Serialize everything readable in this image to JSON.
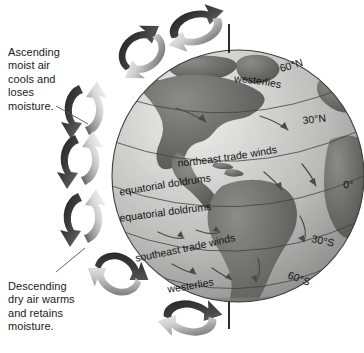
{
  "figure": {
    "background_color": "#ffffff",
    "ink_color": "#1a1a1a"
  },
  "callouts": [
    {
      "id": "ascending",
      "text": "Ascending\nmoist air\ncools and\nloses\nmoisture.",
      "leader_from": [
        56,
        106
      ],
      "leader_to": [
        88,
        124
      ]
    },
    {
      "id": "descending",
      "text": "Descending\ndry air warms\nand retains\nmoisture.",
      "leader_from": [
        56,
        272
      ],
      "leader_to": [
        85,
        248
      ]
    }
  ],
  "globe": {
    "center_x": 238,
    "center_y": 176,
    "radius": 126,
    "ocean_color": "#b8b8b8",
    "ocean_highlight": "#e8e8e6",
    "land_color": "#6f6f6f",
    "outline_color": "#4a4a4a",
    "axis_color": "#151515"
  },
  "latitude_labels": [
    {
      "id": "lat-60n",
      "text": "60°N",
      "x": 281,
      "y": 72,
      "rotate": -16
    },
    {
      "id": "lat-30n",
      "text": "30°N",
      "x": 303,
      "y": 124,
      "rotate": -6
    },
    {
      "id": "lat-0",
      "text": "0°",
      "x": 343,
      "y": 188,
      "rotate": 3
    },
    {
      "id": "lat-30s",
      "text": "30°S",
      "x": 311,
      "y": 242,
      "rotate": 12
    },
    {
      "id": "lat-60s",
      "text": "60°S",
      "x": 287,
      "y": 278,
      "rotate": 20
    }
  ],
  "wind_bands": [
    {
      "id": "westerlies-north",
      "text": "westerlies",
      "path": "north-westerlies"
    },
    {
      "id": "northeast-trades",
      "text": "northeast trade winds",
      "path": "ne-trades"
    },
    {
      "id": "doldrums-upper",
      "text": "equatorial doldrums",
      "path": "doldrums-upper"
    },
    {
      "id": "doldrums-lower",
      "text": "equatorial doldrums",
      "path": "doldrums-lower"
    },
    {
      "id": "southeast-trades",
      "text": "southeast trade winds",
      "path": "se-trades"
    },
    {
      "id": "westerlies-south",
      "text": "westerlies",
      "path": "south-westerlies"
    }
  ],
  "circulation_cells": [
    {
      "id": "cell-polar-north-top",
      "cx": 196,
      "cy": 28,
      "rx": 28,
      "ry": 19,
      "tilt": -14
    },
    {
      "id": "cell-ferrel-north-top",
      "cx": 142,
      "cy": 52,
      "rx": 26,
      "ry": 22,
      "tilt": -34
    },
    {
      "id": "cell-hadley-north-upper",
      "cx": 84,
      "cy": 110,
      "rx": 21,
      "ry": 26,
      "tilt": 0
    },
    {
      "id": "cell-hadley-north-lower",
      "cx": 80,
      "cy": 160,
      "rx": 21,
      "ry": 26,
      "tilt": 0
    },
    {
      "id": "cell-hadley-south-upper",
      "cx": 83,
      "cy": 218,
      "rx": 21,
      "ry": 26,
      "tilt": 0
    },
    {
      "id": "cell-ferrel-south",
      "cx": 118,
      "cy": 274,
      "rx": 25,
      "ry": 23,
      "tilt": 30
    },
    {
      "id": "cell-polar-south-bottom",
      "cx": 190,
      "cy": 318,
      "rx": 28,
      "ry": 19,
      "tilt": 12
    }
  ],
  "polar_axis": [
    {
      "id": "axis-north",
      "x": 229,
      "y1": 24,
      "y2": 53
    },
    {
      "id": "axis-south",
      "x": 229,
      "y1": 302,
      "y2": 329
    }
  ]
}
